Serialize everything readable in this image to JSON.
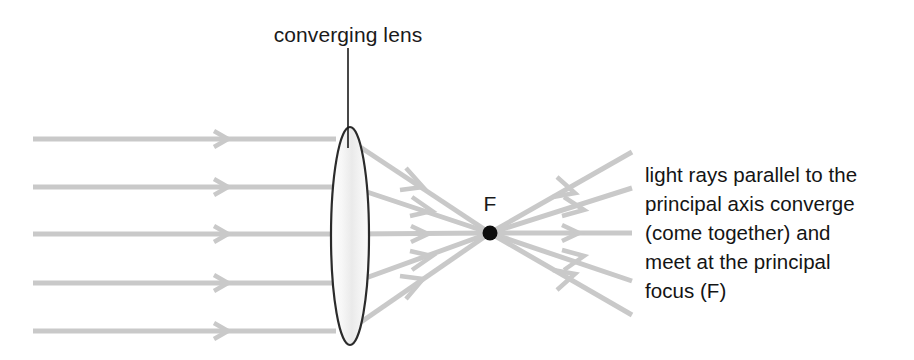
{
  "figure": {
    "kind": "optics-ray-diagram",
    "background_color": "#ffffff",
    "lens_label": "converging lens",
    "focus_label": "F",
    "ray_color": "#c9c9c9",
    "lens_outline_color": "#2b2b2b",
    "text_color": "#141414"
  },
  "caption": {
    "lines": [
      "light rays parallel to the",
      "principal axis converge",
      "(come together) and",
      "meet at the principal",
      "focus (F)"
    ]
  },
  "geometry": {
    "lens": {
      "center_x": 350,
      "center_y": 236,
      "half_width": 19,
      "half_height": 109
    },
    "focus_point": {
      "x": 490,
      "y": 233,
      "radius": 7
    },
    "incoming_ray_y": [
      139,
      187,
      234,
      283,
      331
    ],
    "incoming_ray_start_x": 33,
    "diverging_end_x": 632,
    "leader_line": {
      "x": 348,
      "y_top": 48,
      "y_bottom": 148
    }
  }
}
